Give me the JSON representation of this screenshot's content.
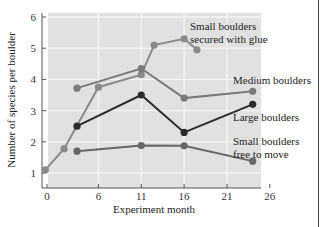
{
  "chart_data": {
    "type": "line",
    "title": "",
    "xlabel": "Experiment month",
    "ylabel": "Number of species per boulder",
    "xlim": [
      -0.5,
      26
    ],
    "ylim": [
      0.7,
      6.2
    ],
    "xticks": [
      0,
      6,
      11,
      16,
      21,
      26
    ],
    "yticks": [
      1,
      2,
      3,
      4,
      5,
      6
    ],
    "grid": true,
    "legend": "inline labels at right of lines",
    "series": [
      {
        "name": "Small boulders secured with glue",
        "label_lines": [
          "Small boulders",
          "secured with glue"
        ],
        "color": "#8a8a8a",
        "x": [
          -0.2,
          2,
          6,
          11,
          12.5,
          16,
          17.5
        ],
        "y": [
          1.1,
          1.78,
          3.75,
          4.15,
          5.1,
          5.3,
          4.95
        ]
      },
      {
        "name": "Medium boulders",
        "label_lines": [
          "Medium boulders"
        ],
        "color": "#7a7a7a",
        "x": [
          3.5,
          11,
          16,
          24
        ],
        "y": [
          3.72,
          4.35,
          3.4,
          3.62
        ]
      },
      {
        "name": "Large boulders",
        "label_lines": [
          "Large boulders"
        ],
        "color": "#2b2b2b",
        "x": [
          3.5,
          11,
          16,
          24
        ],
        "y": [
          2.5,
          3.5,
          2.3,
          3.2
        ]
      },
      {
        "name": "Small boulders free to move",
        "label_lines": [
          "Small boulders",
          "free to move"
        ],
        "color": "#666666",
        "x": [
          3.5,
          11,
          16,
          24
        ],
        "y": [
          1.7,
          1.88,
          1.87,
          1.38
        ]
      }
    ]
  },
  "colors": {
    "plot_background": "#e1e1e1",
    "grid": "#f5f5f5",
    "axis": "#555555"
  }
}
